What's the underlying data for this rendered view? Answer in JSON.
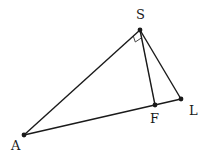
{
  "diagram": {
    "type": "triangle",
    "points": [
      {
        "id": "S",
        "label": "S"
      },
      {
        "id": "A",
        "label": "A"
      },
      {
        "id": "F",
        "label": "F"
      },
      {
        "id": "L",
        "label": "L"
      }
    ],
    "segments": [
      {
        "from": "S",
        "to": "A"
      },
      {
        "from": "S",
        "to": "F"
      },
      {
        "from": "S",
        "to": "L"
      },
      {
        "from": "A",
        "to": "L"
      }
    ],
    "right_angle": {
      "vertex": "S",
      "between": [
        "A",
        "F"
      ]
    },
    "colors": {
      "stroke": "#1a1a1a",
      "background": "#ffffff"
    }
  }
}
